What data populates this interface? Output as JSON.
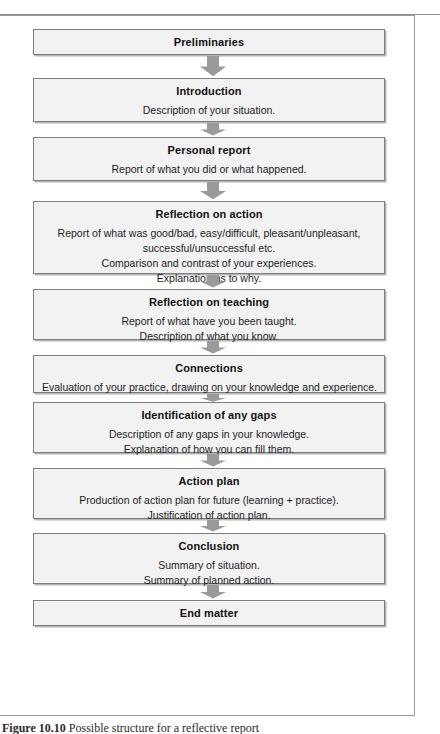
{
  "figure": {
    "caption_label": "Figure 10.10",
    "caption_text": "Possible structure for a reflective report",
    "arrow_icon": "down-arrow-icon",
    "box_fill_color": "#f2f2f2",
    "box_border_color": "#7d7d7d",
    "arrow_color": "#9a9a9a",
    "frame_color": "#9b9b9b"
  },
  "flow": {
    "nodes": [
      {
        "id": "preliminaries",
        "title": "Preliminaries",
        "lines": []
      },
      {
        "id": "introduction",
        "title": "Introduction",
        "lines": [
          "Description of your situation."
        ]
      },
      {
        "id": "personal-report",
        "title": "Personal report",
        "lines": [
          "Report of what you did or what happened."
        ]
      },
      {
        "id": "reflection-on-action",
        "title": "Reflection on action",
        "lines": [
          "Report of what was good/bad, easy/difficult, pleasant/unpleasant,",
          "successful/unsuccessful etc.",
          "Comparison and contrast of your experiences.",
          "Explanation as to why."
        ]
      },
      {
        "id": "reflection-on-teaching",
        "title": "Reflection on teaching",
        "lines": [
          "Report of what have you been taught.",
          "Description of what you know."
        ]
      },
      {
        "id": "connections",
        "title": "Connections",
        "lines": [
          "Evaluation of your practice, drawing on your knowledge and experience."
        ]
      },
      {
        "id": "identification-of-any-gaps",
        "title": "Identification of any gaps",
        "lines": [
          "Description of any gaps in your knowledge.",
          "Explanation of how you can fill them."
        ]
      },
      {
        "id": "action-plan",
        "title": "Action plan",
        "lines": [
          "Production of action plan for future (learning + practice).",
          "Justification of action plan."
        ]
      },
      {
        "id": "conclusion",
        "title": "Conclusion",
        "lines": [
          "Summary of situation.",
          "Summary of planned action."
        ]
      },
      {
        "id": "end-matter",
        "title": "End matter",
        "lines": []
      }
    ]
  }
}
